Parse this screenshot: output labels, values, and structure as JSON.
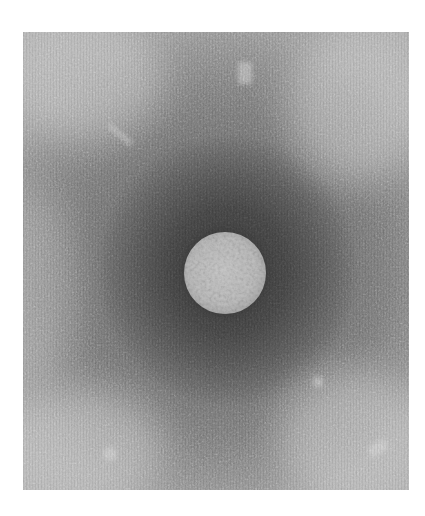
{
  "figure": {
    "type": "electron-micrograph",
    "colors": {
      "background_page": "#ffffff",
      "halo_dark": "#3a3a3a",
      "field_mid": "#888888",
      "field_light": "#b5b5b5",
      "particle": "#c2c2c2"
    },
    "layout": {
      "image_bounds_px": {
        "left": 23,
        "top": 32,
        "right": 409,
        "bottom": 490
      },
      "particle_center_px": [
        225,
        272
      ],
      "particle_radius_px": 41
    }
  }
}
